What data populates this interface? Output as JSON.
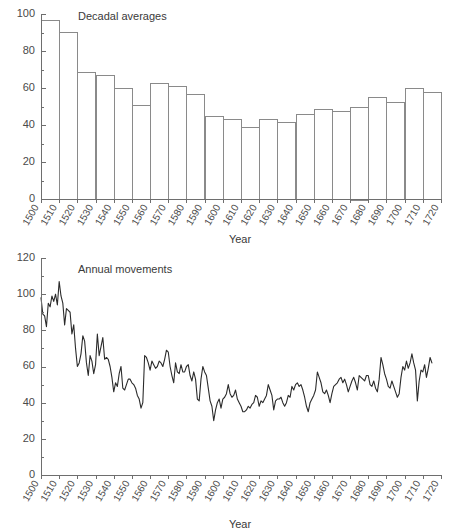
{
  "figure": {
    "background": "#ffffff",
    "line_color": "#2b2b2b",
    "bar_fill": "#ffffff",
    "bar_stroke": "#8a8a8a",
    "axis_color": "#6e6e6e"
  },
  "panels": [
    {
      "id": "decadal",
      "title": "Decadal averages",
      "xlabel": "Year"
    },
    {
      "id": "annual",
      "title": "Annual movements",
      "xlabel": "Year"
    }
  ],
  "chart_data": [
    {
      "type": "bar",
      "title": "Decadal averages",
      "xlabel": "Year",
      "ylabel": "",
      "ylim": [
        0,
        100
      ],
      "yticks": [
        0,
        20,
        40,
        60,
        80,
        100
      ],
      "yminor_step": 10,
      "grid": false,
      "legend": "none",
      "xlim": [
        1500,
        1720
      ],
      "xticks": [
        1500,
        1510,
        1520,
        1530,
        1540,
        1550,
        1560,
        1570,
        1580,
        1590,
        1600,
        1610,
        1620,
        1630,
        1640,
        1650,
        1660,
        1670,
        1680,
        1690,
        1700,
        1710,
        1720
      ],
      "categories": [
        "1500-1510",
        "1510-1520",
        "1520-1530",
        "1530-1540",
        "1540-1550",
        "1550-1560",
        "1560-1570",
        "1570-1580",
        "1580-1590",
        "1590-1600",
        "1600-1610",
        "1610-1620",
        "1620-1630",
        "1630-1640",
        "1640-1650",
        "1650-1660",
        "1660-1670",
        "1670-1680",
        "1680-1690",
        "1690-1700",
        "1700-1710",
        "1710-1720"
      ],
      "bar_starts": [
        1500,
        1510,
        1520,
        1530,
        1540,
        1550,
        1560,
        1570,
        1580,
        1590,
        1600,
        1610,
        1620,
        1630,
        1640,
        1650,
        1660,
        1670,
        1680,
        1690,
        1700,
        1710
      ],
      "values": [
        97,
        90.5,
        68.5,
        67,
        60,
        51,
        62.5,
        61,
        57,
        45,
        43,
        39,
        43.5,
        41.5,
        46,
        48.5,
        47.5,
        50,
        55,
        52.5,
        60,
        58
      ]
    },
    {
      "type": "line",
      "title": "Annual movements",
      "xlabel": "Year",
      "ylabel": "",
      "ylim": [
        0,
        120
      ],
      "yticks": [
        0,
        20,
        40,
        60,
        80,
        100,
        120
      ],
      "yminor_step": 10,
      "grid": false,
      "legend": "none",
      "xlim": [
        1500,
        1720
      ],
      "xticks": [
        1500,
        1510,
        1520,
        1530,
        1540,
        1550,
        1560,
        1570,
        1580,
        1590,
        1600,
        1610,
        1620,
        1630,
        1640,
        1650,
        1660,
        1670,
        1680,
        1690,
        1700,
        1710,
        1720
      ],
      "x": [
        1500,
        1501,
        1502,
        1503,
        1504,
        1505,
        1506,
        1507,
        1508,
        1509,
        1510,
        1511,
        1512,
        1513,
        1514,
        1515,
        1516,
        1517,
        1518,
        1519,
        1520,
        1521,
        1522,
        1523,
        1524,
        1525,
        1526,
        1527,
        1528,
        1529,
        1530,
        1531,
        1532,
        1533,
        1534,
        1535,
        1536,
        1537,
        1538,
        1539,
        1540,
        1541,
        1542,
        1543,
        1544,
        1545,
        1546,
        1547,
        1548,
        1549,
        1550,
        1551,
        1552,
        1553,
        1554,
        1555,
        1556,
        1557,
        1558,
        1559,
        1560,
        1561,
        1562,
        1563,
        1564,
        1565,
        1566,
        1567,
        1568,
        1569,
        1570,
        1571,
        1572,
        1573,
        1574,
        1575,
        1576,
        1577,
        1578,
        1579,
        1580,
        1581,
        1582,
        1583,
        1584,
        1585,
        1586,
        1587,
        1588,
        1589,
        1590,
        1591,
        1592,
        1593,
        1594,
        1595,
        1596,
        1597,
        1598,
        1599,
        1600,
        1601,
        1602,
        1603,
        1604,
        1605,
        1606,
        1607,
        1608,
        1609,
        1610,
        1611,
        1612,
        1613,
        1614,
        1615,
        1616,
        1617,
        1618,
        1619,
        1620,
        1621,
        1622,
        1623,
        1624,
        1625,
        1626,
        1627,
        1628,
        1629,
        1630,
        1631,
        1632,
        1633,
        1634,
        1635,
        1636,
        1637,
        1638,
        1639,
        1640,
        1641,
        1642,
        1643,
        1644,
        1645,
        1646,
        1647,
        1648,
        1649,
        1650,
        1651,
        1652,
        1653,
        1654,
        1655,
        1656,
        1657,
        1658,
        1659,
        1660,
        1661,
        1662,
        1663,
        1664,
        1665,
        1666,
        1667,
        1668,
        1669,
        1670,
        1671,
        1672,
        1673,
        1674,
        1675,
        1676,
        1677,
        1678,
        1679,
        1680,
        1681,
        1682,
        1683,
        1684,
        1685,
        1686,
        1687,
        1688,
        1689,
        1690,
        1691,
        1692,
        1693,
        1694,
        1695,
        1696,
        1697,
        1698,
        1699,
        1700,
        1701,
        1702,
        1703,
        1704,
        1705,
        1706,
        1707,
        1708,
        1709,
        1710,
        1711,
        1712,
        1713,
        1714,
        1715,
        1716,
        1717,
        1718
      ],
      "y": [
        98,
        89,
        88,
        82,
        95,
        93,
        99,
        96,
        100,
        94,
        107,
        99,
        95,
        83,
        92,
        91,
        90,
        78,
        83,
        70,
        60,
        62,
        67,
        77,
        74,
        62,
        55,
        66,
        63,
        56,
        61,
        78,
        66,
        71,
        76,
        64,
        65,
        64,
        60,
        54,
        46,
        51,
        49,
        56,
        60,
        48,
        47,
        50,
        53,
        53,
        51,
        50,
        48,
        44,
        42,
        37,
        40,
        66,
        65,
        62,
        58,
        63,
        61,
        59,
        60,
        63,
        62,
        60,
        64,
        69,
        68,
        60,
        55,
        51,
        62,
        57,
        56,
        61,
        57,
        57,
        60,
        61,
        55,
        52,
        57,
        53,
        42,
        41,
        53,
        60,
        57,
        55,
        48,
        41,
        38,
        30,
        36,
        40,
        42,
        37,
        42,
        43,
        45,
        50,
        45,
        43,
        44,
        47,
        42,
        40,
        38,
        35,
        35,
        36,
        38,
        37,
        39,
        40,
        44,
        43,
        38,
        41,
        40,
        42,
        44,
        50,
        47,
        44,
        36,
        41,
        42,
        42,
        43,
        40,
        38,
        40,
        44,
        43,
        49,
        47,
        50,
        51,
        49,
        50,
        47,
        43,
        38,
        35,
        40,
        42,
        44,
        47,
        57,
        54,
        51,
        46,
        45,
        47,
        44,
        40,
        45,
        49,
        50,
        51,
        53,
        54,
        51,
        53,
        50,
        46,
        49,
        52,
        54,
        51,
        47,
        55,
        54,
        53,
        52,
        55,
        55,
        50,
        49,
        52,
        48,
        46,
        53,
        65,
        61,
        56,
        53,
        49,
        48,
        52,
        49,
        46,
        43,
        45,
        54,
        60,
        58,
        63,
        59,
        62,
        67,
        62,
        58,
        41,
        52,
        58,
        57,
        61,
        54,
        59,
        65,
        62
      ]
    }
  ]
}
